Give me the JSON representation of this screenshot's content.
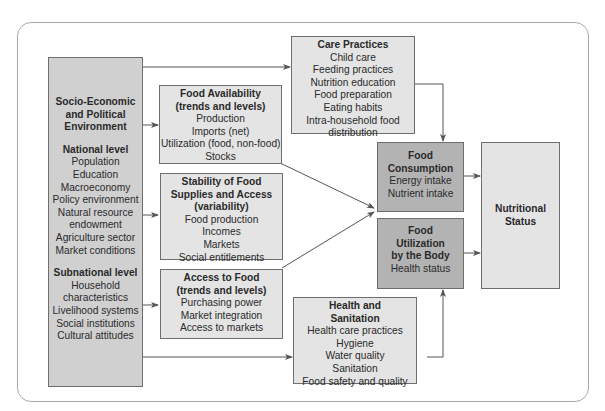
{
  "diagram": {
    "type": "conceptual-framework",
    "colors": {
      "frame": "#a9a9a9",
      "box_light": "#e4e4e4",
      "box_mid": "#d0d0d0",
      "box_dark": "#b3b3b3",
      "border": "#6e6e6e",
      "arrow": "#555555"
    },
    "socio_economic": {
      "title_lines": [
        "Socio-Economic",
        "and Political",
        "Environment"
      ],
      "national": {
        "heading": "National level",
        "items": [
          "Population",
          "Education",
          "Macroeconomy",
          "Policy environment",
          "Natural resource",
          "endowment",
          "Agriculture sector",
          "Market conditions"
        ]
      },
      "subnational": {
        "heading": "Subnational level",
        "items": [
          "Household",
          "characteristics",
          "Livelihood systems",
          "Social institutions",
          "Cultural attitudes"
        ]
      }
    },
    "food_availability": {
      "title_lines": [
        "Food Availability",
        "(trends and levels)"
      ],
      "items": [
        "Production",
        "Imports (net)",
        "Utilization (food, non-food)",
        "Stocks"
      ]
    },
    "stability": {
      "title_lines": [
        "Stability of Food",
        "Supplies and Access",
        "(variability)"
      ],
      "items": [
        "Food production",
        "Incomes",
        "Markets",
        "Social entitlements"
      ]
    },
    "access": {
      "title_lines": [
        "Access to Food",
        "(trends and levels)"
      ],
      "items": [
        "Purchasing power",
        "Market integration",
        "Access to markets"
      ]
    },
    "care_practices": {
      "title_lines": [
        "Care Practices"
      ],
      "items": [
        "Child care",
        "Feeding practices",
        "Nutrition education",
        "Food preparation",
        "Eating habits",
        "Intra-household food",
        "distribution"
      ]
    },
    "health_sanitation": {
      "title_lines": [
        "Health and",
        "Sanitation"
      ],
      "items": [
        "Health care practices",
        "Hygiene",
        "Water quality",
        "Sanitation",
        "Food safety and quality"
      ]
    },
    "food_consumption": {
      "title_lines": [
        "Food",
        "Consumption"
      ],
      "items": [
        "Energy intake",
        "Nutrient intake"
      ]
    },
    "food_utilization": {
      "title_lines": [
        "Food",
        "Utilization",
        "by the Body"
      ],
      "items": [
        "Health status"
      ]
    },
    "nutritional_status": {
      "title_lines": [
        "Nutritional",
        "Status"
      ]
    },
    "edges": [
      {
        "from": "socio_economic",
        "to": "care_practices"
      },
      {
        "from": "socio_economic",
        "to": "food_availability"
      },
      {
        "from": "socio_economic",
        "to": "stability"
      },
      {
        "from": "socio_economic",
        "to": "access"
      },
      {
        "from": "socio_economic",
        "to": "health_sanitation"
      },
      {
        "from": "food_availability",
        "to": "food_consumption"
      },
      {
        "from": "stability",
        "to": "food_consumption"
      },
      {
        "from": "access",
        "to": "food_consumption"
      },
      {
        "from": "care_practices",
        "to": "food_consumption"
      },
      {
        "from": "health_sanitation",
        "to": "food_utilization"
      },
      {
        "from": "food_consumption",
        "to": "nutritional_status"
      },
      {
        "from": "food_utilization",
        "to": "nutritional_status"
      }
    ]
  }
}
